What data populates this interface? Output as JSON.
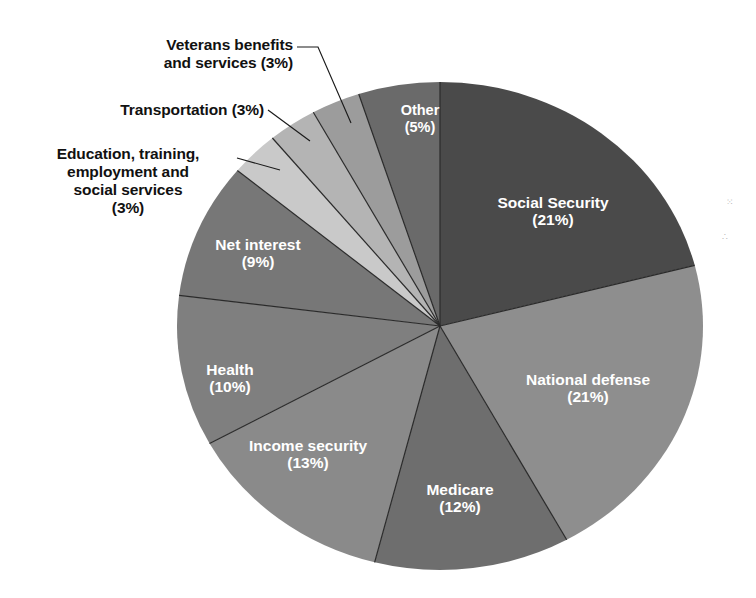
{
  "chart_data": {
    "type": "pie",
    "title": "",
    "subtitle": "",
    "xlabel": "",
    "ylabel": "",
    "legend_position": "none",
    "grid": false,
    "units": "percent",
    "total": 100,
    "value_label_format": "(N%)",
    "start_angle_deg": 0,
    "direction": "clockwise",
    "categories": [
      "Social Security",
      "National defense",
      "Medicare",
      "Income security",
      "Health",
      "Net interest",
      "Education, training, employment and social services",
      "Transportation",
      "Veterans benefits and services",
      "Other"
    ],
    "values": [
      21,
      21,
      12,
      13,
      10,
      9,
      3,
      3,
      3,
      5
    ],
    "labels": [
      "Social Security\n(21%)",
      "National defense\n(21%)",
      "Medicare\n(12%)",
      "Income security\n(13%)",
      "Health\n(10%)",
      "Net interest\n(9%)",
      "Education, training,\nemployment and\nsocial services\n(3%)",
      "Transportation (3%)",
      "Veterans benefits\nand services (3%)",
      "Other\n(5%)"
    ],
    "colors": [
      "#4a4a4a",
      "#8e8e8e",
      "#6e6e6e",
      "#8a8a8a",
      "#7f7f7f",
      "#777777",
      "#c9c9c9",
      "#b4b4b4",
      "#9c9c9c",
      "#6a6a6a"
    ],
    "label_placement": [
      "inside",
      "inside",
      "inside",
      "inside",
      "inside",
      "inside",
      "outside",
      "outside",
      "outside",
      "inside"
    ]
  },
  "pie": {
    "center_x": 440,
    "center_y": 326,
    "radius_x": 263,
    "radius_y": 244,
    "separator_color": "#2a2a2a",
    "background": "#ffffff"
  },
  "inside_labels": [
    {
      "key": "social-security",
      "name": "Social Security",
      "line1": "Social Security",
      "line2": "(21%)",
      "x": 553,
      "y": 208
    },
    {
      "key": "national-defense",
      "name": "National defense",
      "line1": "National defense",
      "line2": "(21%)",
      "x": 588,
      "y": 385
    },
    {
      "key": "medicare",
      "name": "Medicare",
      "line1": "Medicare",
      "line2": "(12%)",
      "x": 460,
      "y": 495
    },
    {
      "key": "income-security",
      "name": "Income security",
      "line1": "Income security",
      "line2": "(13%)",
      "x": 308,
      "y": 451
    },
    {
      "key": "health",
      "name": "Health",
      "line1": "Health",
      "line2": "(10%)",
      "x": 230,
      "y": 375
    },
    {
      "key": "net-interest",
      "name": "Net interest",
      "line1": "Net interest",
      "line2": "(9%)",
      "x": 258,
      "y": 250
    },
    {
      "key": "other",
      "name": "Other",
      "line1": "Other",
      "line2": "(5%)",
      "x": 420,
      "y": 115
    }
  ],
  "outside_labels": [
    {
      "key": "veterans",
      "name": "Veterans benefits and services",
      "text": "Veterans benefits\nand services (3%)",
      "left": 60,
      "top": 36,
      "width": 233,
      "align": "ta-right"
    },
    {
      "key": "transportation",
      "name": "Transportation",
      "text": "Transportation (3%)",
      "left": 30,
      "top": 101,
      "width": 234,
      "align": "ta-right"
    },
    {
      "key": "education",
      "name": "Education, training, employment and social services",
      "text": "Education, training,\nemployment and\nsocial services\n(3%)",
      "left": 22,
      "top": 145,
      "width": 212,
      "align": "ta-center"
    }
  ],
  "leader_lines": [
    {
      "key": "veterans",
      "name": "veterans-leader-line",
      "path": "M 297 47 L 318 47 L 351 123"
    },
    {
      "key": "transportation",
      "name": "transportation-leader-line",
      "path": "M 268 110 L 310 141"
    },
    {
      "key": "education",
      "name": "education-leader-line",
      "path": "M 237 158 L 280 170"
    }
  ],
  "specks": [
    {
      "key": "speck-top",
      "glyph": "⁙",
      "left": 726,
      "top": 197
    },
    {
      "key": "speck-bottom",
      "glyph": "∴",
      "left": 722,
      "top": 232
    }
  ]
}
